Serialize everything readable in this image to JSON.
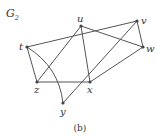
{
  "graph": {
    "title": "G",
    "title_subscript": "2",
    "caption": "(b)",
    "nodes": [
      {
        "id": "t",
        "label": "t",
        "x": 27,
        "y": 47,
        "lx": 19,
        "ly": 50
      },
      {
        "id": "u",
        "label": "u",
        "x": 81,
        "y": 26,
        "lx": 77,
        "ly": 22
      },
      {
        "id": "v",
        "label": "v",
        "x": 137,
        "y": 21,
        "lx": 141,
        "ly": 24
      },
      {
        "id": "w",
        "label": "w",
        "x": 143,
        "y": 47,
        "lx": 146,
        "ly": 52
      },
      {
        "id": "z",
        "label": "z",
        "x": 37,
        "y": 82,
        "lx": 34,
        "ly": 93
      },
      {
        "id": "x",
        "label": "x",
        "x": 90,
        "y": 82,
        "lx": 87,
        "ly": 93
      },
      {
        "id": "y",
        "label": "y",
        "x": 63,
        "y": 103,
        "lx": 60,
        "ly": 115
      }
    ],
    "edges": [
      {
        "from": "t",
        "to": "v"
      },
      {
        "from": "t",
        "to": "z"
      },
      {
        "from": "t",
        "to": "y",
        "curved": true
      },
      {
        "from": "u",
        "to": "z"
      },
      {
        "from": "u",
        "to": "x"
      },
      {
        "from": "u",
        "to": "w"
      },
      {
        "from": "v",
        "to": "w"
      },
      {
        "from": "v",
        "to": "y"
      },
      {
        "from": "z",
        "to": "x"
      },
      {
        "from": "x",
        "to": "w"
      }
    ]
  }
}
